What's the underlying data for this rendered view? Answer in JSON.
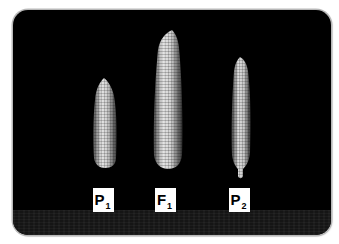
{
  "figure": {
    "background_color": "#000000",
    "frame_border_color": "#b8b8b8",
    "table_surface_color": "#151515"
  },
  "ears": [
    {
      "id": "P1",
      "label_main": "P",
      "label_sub": "1",
      "description": "parent 1 corn ear, short and wide"
    },
    {
      "id": "F1",
      "label_main": "F",
      "label_sub": "1",
      "description": "F1 hybrid corn ear, tallest"
    },
    {
      "id": "P2",
      "label_main": "P",
      "label_sub": "2",
      "description": "parent 2 corn ear, slender"
    }
  ]
}
